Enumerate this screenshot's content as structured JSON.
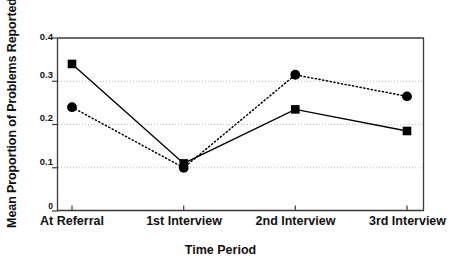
{
  "chart_data": {
    "type": "line",
    "title": "",
    "xlabel": "Time Period",
    "ylabel": "Mean Proportion of Problems Reported",
    "categories": [
      "At Referral",
      "1st Interview",
      "2nd Interview",
      "3rd Interview"
    ],
    "ylim": [
      0,
      0.4
    ],
    "yticks": [
      0,
      0.1,
      0.2,
      0.3,
      0.4
    ],
    "ytick_labels": [
      "0",
      "0.1",
      "0.2",
      "0.3",
      "0.4"
    ],
    "grid": true,
    "gridlines_at": [
      0.1,
      0.2,
      0.3
    ],
    "legend": "none",
    "series": [
      {
        "name": "series-solid-square",
        "marker": "square",
        "linestyle": "solid",
        "color": "#000000",
        "values": [
          0.34,
          0.11,
          0.235,
          0.185
        ]
      },
      {
        "name": "series-dotted-circle",
        "marker": "circle",
        "linestyle": "dotted",
        "color": "#000000",
        "values": [
          0.24,
          0.1,
          0.315,
          0.265
        ]
      }
    ]
  },
  "axes": {
    "ytick_0": "0",
    "ytick_1": "0.1",
    "ytick_2": "0.2",
    "ytick_3": "0.3",
    "ytick_4": "0.4",
    "xtick_0": "At Referral",
    "xtick_1": "1st Interview",
    "xtick_2": "2nd Interview",
    "xtick_3": "3rd Interview",
    "x_axis_title": "Time Period",
    "y_axis_title": "Mean Proportion of Problems Reported"
  },
  "colors": {
    "ink": "#000000",
    "frame": "#3a3a3a",
    "grid": "#b8b8b8",
    "background": "#ffffff"
  }
}
